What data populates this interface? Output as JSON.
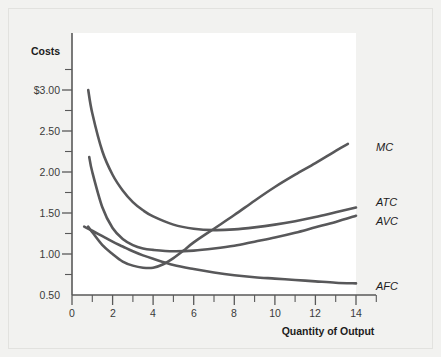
{
  "figure": {
    "background_color": "#f2f2f0",
    "plot_background_color": "#ffffff",
    "curve_color": "#58585a",
    "axis_color": "#595959"
  },
  "axis_titles": {
    "y": "Costs",
    "x": "Quantity of Output"
  },
  "y_ticks": [
    "$3.00",
    "2.50",
    "2.00",
    "1.50",
    "1.00",
    "0.50"
  ],
  "x_ticks": [
    "0",
    "2",
    "4",
    "6",
    "8",
    "10",
    "12",
    "14"
  ],
  "series_labels": {
    "mc": "MC",
    "atc": "ATC",
    "avc": "AVC",
    "afc": "AFC"
  },
  "chart_data": {
    "type": "line",
    "title": "",
    "subtitle": "",
    "xlabel": "Quantity of Output",
    "ylabel": "Costs",
    "xlim": [
      0,
      15
    ],
    "ylim": [
      0,
      3.25
    ],
    "grid": false,
    "legend_position": "right-inline-labels",
    "x_tick_values": [
      0,
      2,
      4,
      6,
      8,
      10,
      12,
      14
    ],
    "x_minor_tick_values": [
      1,
      3,
      5,
      7,
      9,
      11,
      13,
      15
    ],
    "y_tick_values": [
      0.5,
      1.0,
      1.5,
      2.0,
      2.5,
      3.0
    ],
    "y_tick_labels": [
      "0.50",
      "1.00",
      "1.50",
      "2.00",
      "2.50",
      "$3.00"
    ],
    "y_minor_tick_values": [
      0.25,
      0.75,
      1.25,
      1.75,
      2.25,
      2.75,
      3.25
    ],
    "series": [
      {
        "name": "ATC",
        "label": "ATC",
        "description": "Average Total Cost: U-shaped, falls steeply from $3.00 then rises slowly",
        "x": [
          0.8,
          1.0,
          1.5,
          2.0,
          2.5,
          3.0,
          3.5,
          4.0,
          5.0,
          6.0,
          7.0,
          8.0,
          9.0,
          10.0,
          11.0,
          12.0,
          13.0,
          14.0
        ],
        "y": [
          3.0,
          2.66,
          2.1,
          1.76,
          1.53,
          1.36,
          1.24,
          1.15,
          1.03,
          0.97,
          0.95,
          0.96,
          0.99,
          1.03,
          1.08,
          1.14,
          1.21,
          1.28
        ]
      },
      {
        "name": "AVC",
        "label": "AVC",
        "description": "Average Variable Cost: U-shaped, falls from $2.00, minimum near q=5, rises slowly",
        "x": [
          0.85,
          1.0,
          1.5,
          2.0,
          2.5,
          3.0,
          3.5,
          4.0,
          5.0,
          6.0,
          7.0,
          8.0,
          9.0,
          10.0,
          11.0,
          12.0,
          13.0,
          14.0
        ],
        "y": [
          2.02,
          1.8,
          1.28,
          0.98,
          0.82,
          0.73,
          0.68,
          0.66,
          0.64,
          0.65,
          0.68,
          0.72,
          0.78,
          0.84,
          0.91,
          0.99,
          1.07,
          1.16
        ]
      },
      {
        "name": "MC",
        "label": "MC",
        "description": "Marginal Cost: dips to about $0.40 near q=3.5 then rises steeply, crossing AVC near q=5 and ATC near q=7",
        "x": [
          0.8,
          1.0,
          1.5,
          2.0,
          2.5,
          3.0,
          3.5,
          4.0,
          4.5,
          5.0,
          5.5,
          6.0,
          7.0,
          8.0,
          9.0,
          10.0,
          11.0,
          12.0,
          13.0,
          13.6
        ],
        "y": [
          1.0,
          0.92,
          0.73,
          0.6,
          0.49,
          0.43,
          0.4,
          0.4,
          0.45,
          0.54,
          0.65,
          0.77,
          0.97,
          1.17,
          1.38,
          1.58,
          1.76,
          1.93,
          2.11,
          2.21
        ]
      },
      {
        "name": "AFC",
        "label": "AFC",
        "description": "Average Fixed Cost: continuously declining hyperbola approaching zero",
        "x": [
          0.6,
          1.0,
          1.5,
          2.0,
          2.5,
          3.0,
          3.5,
          4.0,
          5.0,
          6.0,
          7.0,
          8.0,
          9.0,
          10.0,
          11.0,
          12.0,
          13.0,
          14.0
        ],
        "y": [
          1.0,
          0.94,
          0.86,
          0.78,
          0.71,
          0.64,
          0.58,
          0.53,
          0.44,
          0.38,
          0.33,
          0.29,
          0.26,
          0.24,
          0.22,
          0.2,
          0.18,
          0.17
        ]
      }
    ],
    "annotations": [
      {
        "text": "MC",
        "x": 14.0,
        "y": 2.21
      },
      {
        "text": "ATC",
        "x": 14.2,
        "y": 1.28
      },
      {
        "text": "AVC",
        "x": 14.2,
        "y": 1.12
      },
      {
        "text": "AFC",
        "x": 14.3,
        "y": 0.16
      }
    ]
  }
}
